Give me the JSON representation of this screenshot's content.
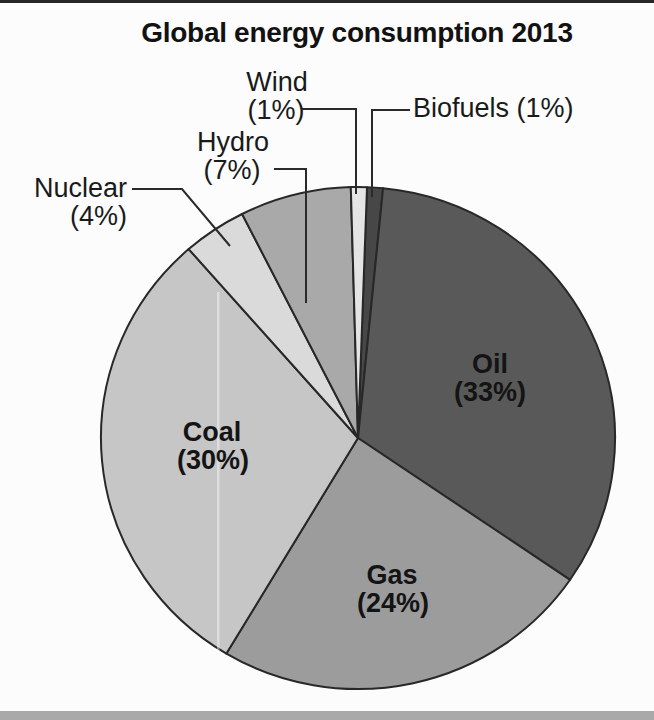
{
  "chart_data": {
    "type": "pie",
    "title": "Global energy consumption 2013",
    "direction": "clockwise",
    "rotation_deg": 2,
    "legend": "none",
    "slices": [
      {
        "label": "Biofuels",
        "value": 1,
        "pct_label": "(1%)",
        "color": "#474747"
      },
      {
        "label": "Oil",
        "value": 33,
        "pct_label": "(33%)",
        "color": "#595959"
      },
      {
        "label": "Gas",
        "value": 24,
        "pct_label": "(24%)",
        "color": "#9c9c9c"
      },
      {
        "label": "Coal",
        "value": 30,
        "pct_label": "(30%)",
        "color": "#c6c6c6"
      },
      {
        "label": "Nuclear",
        "value": 4,
        "pct_label": "(4%)",
        "color": "#dadada"
      },
      {
        "label": "Hydro",
        "value": 7,
        "pct_label": "(7%)",
        "color": "#a9a9a9"
      },
      {
        "label": "Wind",
        "value": 1,
        "pct_label": "(1%)",
        "color": "#e4e4e4"
      }
    ]
  },
  "layout": {
    "center": [
      358,
      438
    ],
    "rx": 257,
    "ry": 251,
    "stroke": "#282828",
    "stroke_width": 2,
    "leader_stroke": "#2a2a2a",
    "leader_width": 2,
    "labels": {
      "Oil": {
        "mode": "stacked",
        "align": "center",
        "x": 490,
        "y": 364,
        "x2": 490,
        "y2": 392
      },
      "Gas": {
        "mode": "stacked",
        "align": "center",
        "x": 392,
        "y": 575,
        "x2": 393,
        "y2": 603
      },
      "Coal": {
        "mode": "stacked",
        "align": "center",
        "x": 212,
        "y": 432,
        "x2": 213,
        "y2": 460
      },
      "Nuclear": {
        "mode": "stacked",
        "align": "right",
        "x": 127,
        "y": 188,
        "x2": 127,
        "y2": 216,
        "callout": true,
        "leader": [
          [
            132,
            189
          ],
          [
            182,
            189
          ],
          [
            230,
            246
          ]
        ]
      },
      "Hydro": {
        "mode": "stacked",
        "align": "center",
        "x": 233,
        "y": 142,
        "x2": 232,
        "y2": 170,
        "callout": true,
        "leader": [
          [
            274,
            169
          ],
          [
            306,
            169
          ],
          [
            306,
            303
          ]
        ]
      },
      "Wind": {
        "mode": "stacked",
        "align": "center",
        "x": 277,
        "y": 82,
        "x2": 276,
        "y2": 110,
        "callout": true,
        "leader": [
          [
            302,
            109
          ],
          [
            356,
            109
          ],
          [
            356,
            194
          ]
        ]
      },
      "Biofuels": {
        "mode": "inline",
        "align": "left",
        "x": 413,
        "y": 108,
        "callout": true,
        "leader": [
          [
            410,
            110
          ],
          [
            372,
            110
          ],
          [
            372,
            197
          ]
        ]
      }
    },
    "scan_artifact": {
      "x": 217,
      "y": 292,
      "w": 2.5,
      "h": 365,
      "fill": "rgba(255,255,255,0.4)"
    }
  },
  "styles": {
    "background": "#fcfcfc",
    "top_edge_color": "#262626",
    "bottom_bar_color": "#a9a9a9",
    "title_color": "#121212"
  }
}
